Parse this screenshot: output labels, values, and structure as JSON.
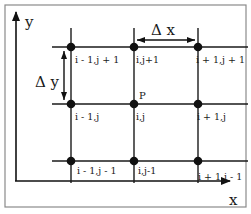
{
  "diagram": {
    "type": "finite-difference-grid",
    "colors": {
      "line": "#1a1a1a",
      "node": "#111111",
      "frame": "#7a7a7a",
      "background": "#ffffff"
    },
    "axes": {
      "x_label": "x",
      "y_label": "y"
    },
    "spacing": {
      "dx_label": "Δ x",
      "dy_label": "Δ y"
    },
    "center_point_label": "P",
    "nodes": [
      {
        "id": "n-im1-jp1",
        "label": "i - 1,j + 1"
      },
      {
        "id": "n-i-jp1",
        "label": "i,j+1"
      },
      {
        "id": "n-ip1-jp1",
        "label": "i + 1,j + 1"
      },
      {
        "id": "n-im1-j",
        "label": "i - 1,j"
      },
      {
        "id": "n-i-j",
        "label": "i,j"
      },
      {
        "id": "n-ip1-j",
        "label": "i + 1,j"
      },
      {
        "id": "n-im1-jm1",
        "label": "i - 1,j - 1"
      },
      {
        "id": "n-i-jm1",
        "label": "i,j-1"
      },
      {
        "id": "n-ip1-jm1",
        "label": "i + 1,j - 1"
      }
    ]
  }
}
